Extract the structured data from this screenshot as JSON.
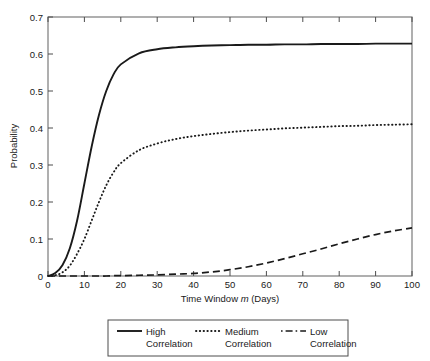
{
  "chart_data": {
    "type": "line",
    "title": "",
    "xlabel": "Time Window m (Days)",
    "xlabel_parts": {
      "pre": "Time Window ",
      "italic": "m",
      "post": " (Days)"
    },
    "ylabel": "Probability",
    "xlim": [
      0,
      100
    ],
    "ylim": [
      0,
      0.7
    ],
    "xticks": [
      "0",
      "10",
      "20",
      "30",
      "40",
      "50",
      "60",
      "70",
      "80",
      "90",
      "100"
    ],
    "yticks": [
      "0",
      "0.1",
      "0.2",
      "0.3",
      "0.4",
      "0.5",
      "0.6",
      "0.7"
    ],
    "grid": false,
    "legend_position": "below-plot",
    "x": [
      0,
      2,
      4,
      6,
      8,
      10,
      12,
      14,
      16,
      18,
      20,
      25,
      30,
      35,
      40,
      45,
      50,
      55,
      60,
      65,
      70,
      75,
      80,
      85,
      90,
      95,
      100
    ],
    "series": [
      {
        "name": "High Correlation",
        "style": "solid",
        "color": "#1a1a1a",
        "values": [
          0.0,
          0.008,
          0.03,
          0.075,
          0.15,
          0.25,
          0.35,
          0.435,
          0.5,
          0.545,
          0.572,
          0.602,
          0.613,
          0.618,
          0.621,
          0.623,
          0.624,
          0.625,
          0.625,
          0.626,
          0.626,
          0.627,
          0.627,
          0.627,
          0.628,
          0.628,
          0.628
        ]
      },
      {
        "name": "Medium Correlation",
        "style": "dotted",
        "color": "#1a1a1a",
        "values": [
          0.0,
          0.002,
          0.01,
          0.028,
          0.06,
          0.1,
          0.15,
          0.2,
          0.245,
          0.28,
          0.305,
          0.34,
          0.358,
          0.37,
          0.378,
          0.384,
          0.389,
          0.393,
          0.396,
          0.399,
          0.401,
          0.403,
          0.405,
          0.406,
          0.408,
          0.409,
          0.41
        ]
      },
      {
        "name": "Low Correlation",
        "style": "dashed",
        "color": "#1a1a1a",
        "values": [
          0.0,
          0.0,
          0.0,
          0.0,
          0.0,
          0.0,
          0.0,
          0.0,
          0.0,
          0.001,
          0.001,
          0.002,
          0.003,
          0.005,
          0.007,
          0.011,
          0.017,
          0.025,
          0.035,
          0.047,
          0.06,
          0.073,
          0.087,
          0.1,
          0.112,
          0.122,
          0.13
        ]
      }
    ]
  },
  "legend": {
    "entries": [
      {
        "line1": "High",
        "line2": "Correlation",
        "style": "solid"
      },
      {
        "line1": "Medium",
        "line2": "Correlation",
        "style": "dotted"
      },
      {
        "line1": "Low",
        "line2": "Correlation",
        "style": "dashed"
      }
    ]
  },
  "colors": {
    "axis": "#4d4d4d",
    "curve": "#1a1a1a",
    "text": "#1a1a1a",
    "background": "#ffffff"
  }
}
